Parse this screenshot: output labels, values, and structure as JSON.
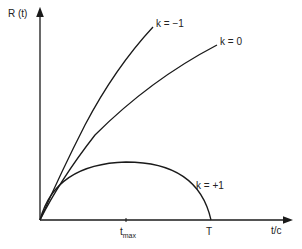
{
  "axes": {
    "y_label": "R (t)",
    "x_label": "t/c"
  },
  "ticks": {
    "tmax_base": "t",
    "tmax_sub": "max",
    "T": "T"
  },
  "curves": [
    {
      "name": "k=-1",
      "label": "k = −1"
    },
    {
      "name": "k=0",
      "label": "k = 0"
    },
    {
      "name": "k=+1",
      "label": "k = +1"
    }
  ],
  "colors": {
    "line": "#1a1a1a"
  }
}
